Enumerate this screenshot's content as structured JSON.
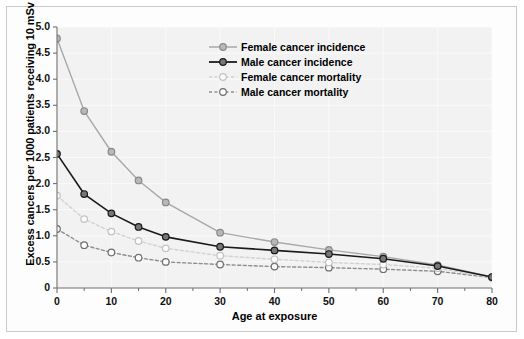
{
  "chart_data": {
    "type": "line",
    "title": "",
    "xlabel": "Age at exposure",
    "ylabel": "Excess cancers per 1000 patients receiving 10 mSv",
    "xlim": [
      0,
      80
    ],
    "ylim": [
      0,
      5.0
    ],
    "xticks": [
      "0",
      "10",
      "20",
      "30",
      "40",
      "50",
      "60",
      "70",
      "80"
    ],
    "xtick_values": [
      0,
      10,
      20,
      30,
      40,
      50,
      60,
      70,
      80
    ],
    "xminor_values": [
      5,
      15,
      25,
      35,
      45,
      55,
      65,
      75
    ],
    "yticks": [
      "0",
      "0.5",
      "1.0",
      "1.5",
      "2.0",
      "2.5",
      "3.0",
      "3.5",
      "4.0",
      "4.5",
      "5.0"
    ],
    "ytick_values": [
      0,
      0.5,
      1.0,
      1.5,
      2.0,
      2.5,
      3.0,
      3.5,
      4.0,
      4.5,
      5.0
    ],
    "grid": true,
    "legend_position": "upper-center",
    "x": [
      0,
      5,
      10,
      15,
      20,
      30,
      40,
      50,
      60,
      70,
      80
    ],
    "series": [
      {
        "name": "Female cancer incidence",
        "values": [
          4.78,
          3.39,
          2.61,
          2.06,
          1.64,
          1.06,
          0.88,
          0.73,
          0.6,
          0.44,
          0.21
        ],
        "color": "#a8a8a8",
        "marker_fill": "#b8b8b8",
        "marker_edge": "#8a8a8a",
        "dash": "none"
      },
      {
        "name": "Male cancer incidence",
        "values": [
          2.57,
          1.8,
          1.43,
          1.17,
          0.98,
          0.79,
          0.72,
          0.65,
          0.56,
          0.42,
          0.21
        ],
        "color": "#1a1a1a",
        "marker_fill": "#777777",
        "marker_edge": "#1a1a1a",
        "dash": "none"
      },
      {
        "name": "Female cancer mortality",
        "values": [
          1.77,
          1.32,
          1.08,
          0.9,
          0.76,
          0.62,
          0.55,
          0.49,
          0.45,
          0.38,
          0.2
        ],
        "color": "#d2d2d2",
        "marker_fill": "#fbfbfb",
        "marker_edge": "#c2c2c2",
        "dash": "3,2.5"
      },
      {
        "name": "Male cancer mortality",
        "values": [
          1.13,
          0.82,
          0.68,
          0.58,
          0.5,
          0.45,
          0.41,
          0.39,
          0.36,
          0.32,
          0.2
        ],
        "color": "#8e8e8e",
        "marker_fill": "#fbfbfb",
        "marker_edge": "#6f6f6f",
        "dash": "3,2.5"
      }
    ]
  },
  "legend": {
    "items": [
      "Female cancer incidence",
      "Male cancer incidence",
      "Female cancer mortality",
      "Male cancer mortality"
    ]
  },
  "colors": {
    "plot_background": "#f2f2f2",
    "figure_background": "#fdfdfd",
    "axis": "#6f6f6f",
    "grid": "#fafafa",
    "frame": "#c9c9c9"
  }
}
